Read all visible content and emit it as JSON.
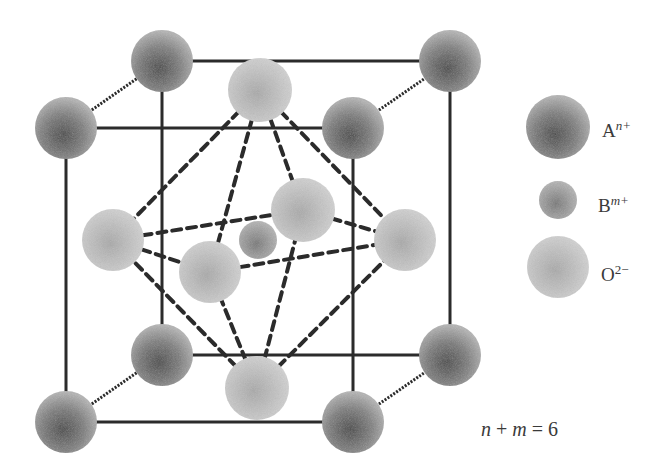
{
  "diagram": {
    "colors": {
      "background": "#ffffff",
      "line": "#2b2b2b",
      "atom_A_dark": "#4a4a4a",
      "atom_A_light": "#a0a0a0",
      "atom_B": "#8c8c8c",
      "atom_O": "#c4c4c4"
    },
    "atoms": {
      "A": [
        {
          "id": "front-top-left",
          "x": 66,
          "y": 128
        },
        {
          "id": "front-top-right",
          "x": 353,
          "y": 128
        },
        {
          "id": "front-bottom-left",
          "x": 66,
          "y": 422
        },
        {
          "id": "front-bottom-right",
          "x": 353,
          "y": 422
        },
        {
          "id": "back-top-left",
          "x": 162,
          "y": 61
        },
        {
          "id": "back-top-right",
          "x": 450,
          "y": 61
        },
        {
          "id": "back-bottom-left",
          "x": 162,
          "y": 355
        },
        {
          "id": "back-bottom-right",
          "x": 450,
          "y": 355
        }
      ],
      "B": [
        {
          "id": "center",
          "x": 258,
          "y": 240
        }
      ],
      "O": [
        {
          "id": "top",
          "x": 260,
          "y": 90
        },
        {
          "id": "bottom",
          "x": 257,
          "y": 388
        },
        {
          "id": "left",
          "x": 113,
          "y": 240
        },
        {
          "id": "right",
          "x": 405,
          "y": 240
        },
        {
          "id": "front",
          "x": 210,
          "y": 272
        },
        {
          "id": "back",
          "x": 303,
          "y": 210
        }
      ]
    }
  },
  "legend": {
    "items": [
      {
        "symbol": "A",
        "superscript": "n+",
        "label": "A^n+"
      },
      {
        "symbol": "B",
        "superscript": "m+",
        "label": "B^m+"
      },
      {
        "symbol": "O",
        "superscript": "2−",
        "label": "O^2−"
      }
    ]
  },
  "formula": {
    "var1": "n",
    "op1": " + ",
    "var2": "m",
    "op2": " = ",
    "value": "6",
    "text": "n + m = 6"
  }
}
